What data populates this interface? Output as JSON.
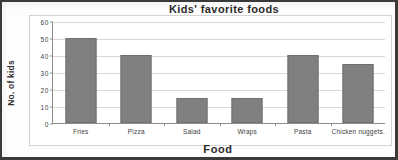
{
  "chart_data": {
    "type": "bar",
    "title": "Kids' favorite foods",
    "xlabel": "Food",
    "ylabel": "No. of kids",
    "categories": [
      "Fries",
      "Pizza",
      "Salad",
      "Wraps",
      "Pasta",
      "Chicken nuggets."
    ],
    "values": [
      50,
      40,
      15,
      15,
      40,
      35
    ],
    "ylim": [
      0,
      60
    ],
    "yticks": [
      0,
      10,
      20,
      30,
      40,
      50,
      60
    ],
    "ytick_labels": [
      "0",
      "10",
      "20",
      "30",
      "40",
      "50",
      "60"
    ],
    "grid": true,
    "legend": false,
    "bar_color": "#808080",
    "gridline_color": "#d8d8d8",
    "axis_color": "#8d8d8d",
    "text_color": "#3d3d3d"
  }
}
